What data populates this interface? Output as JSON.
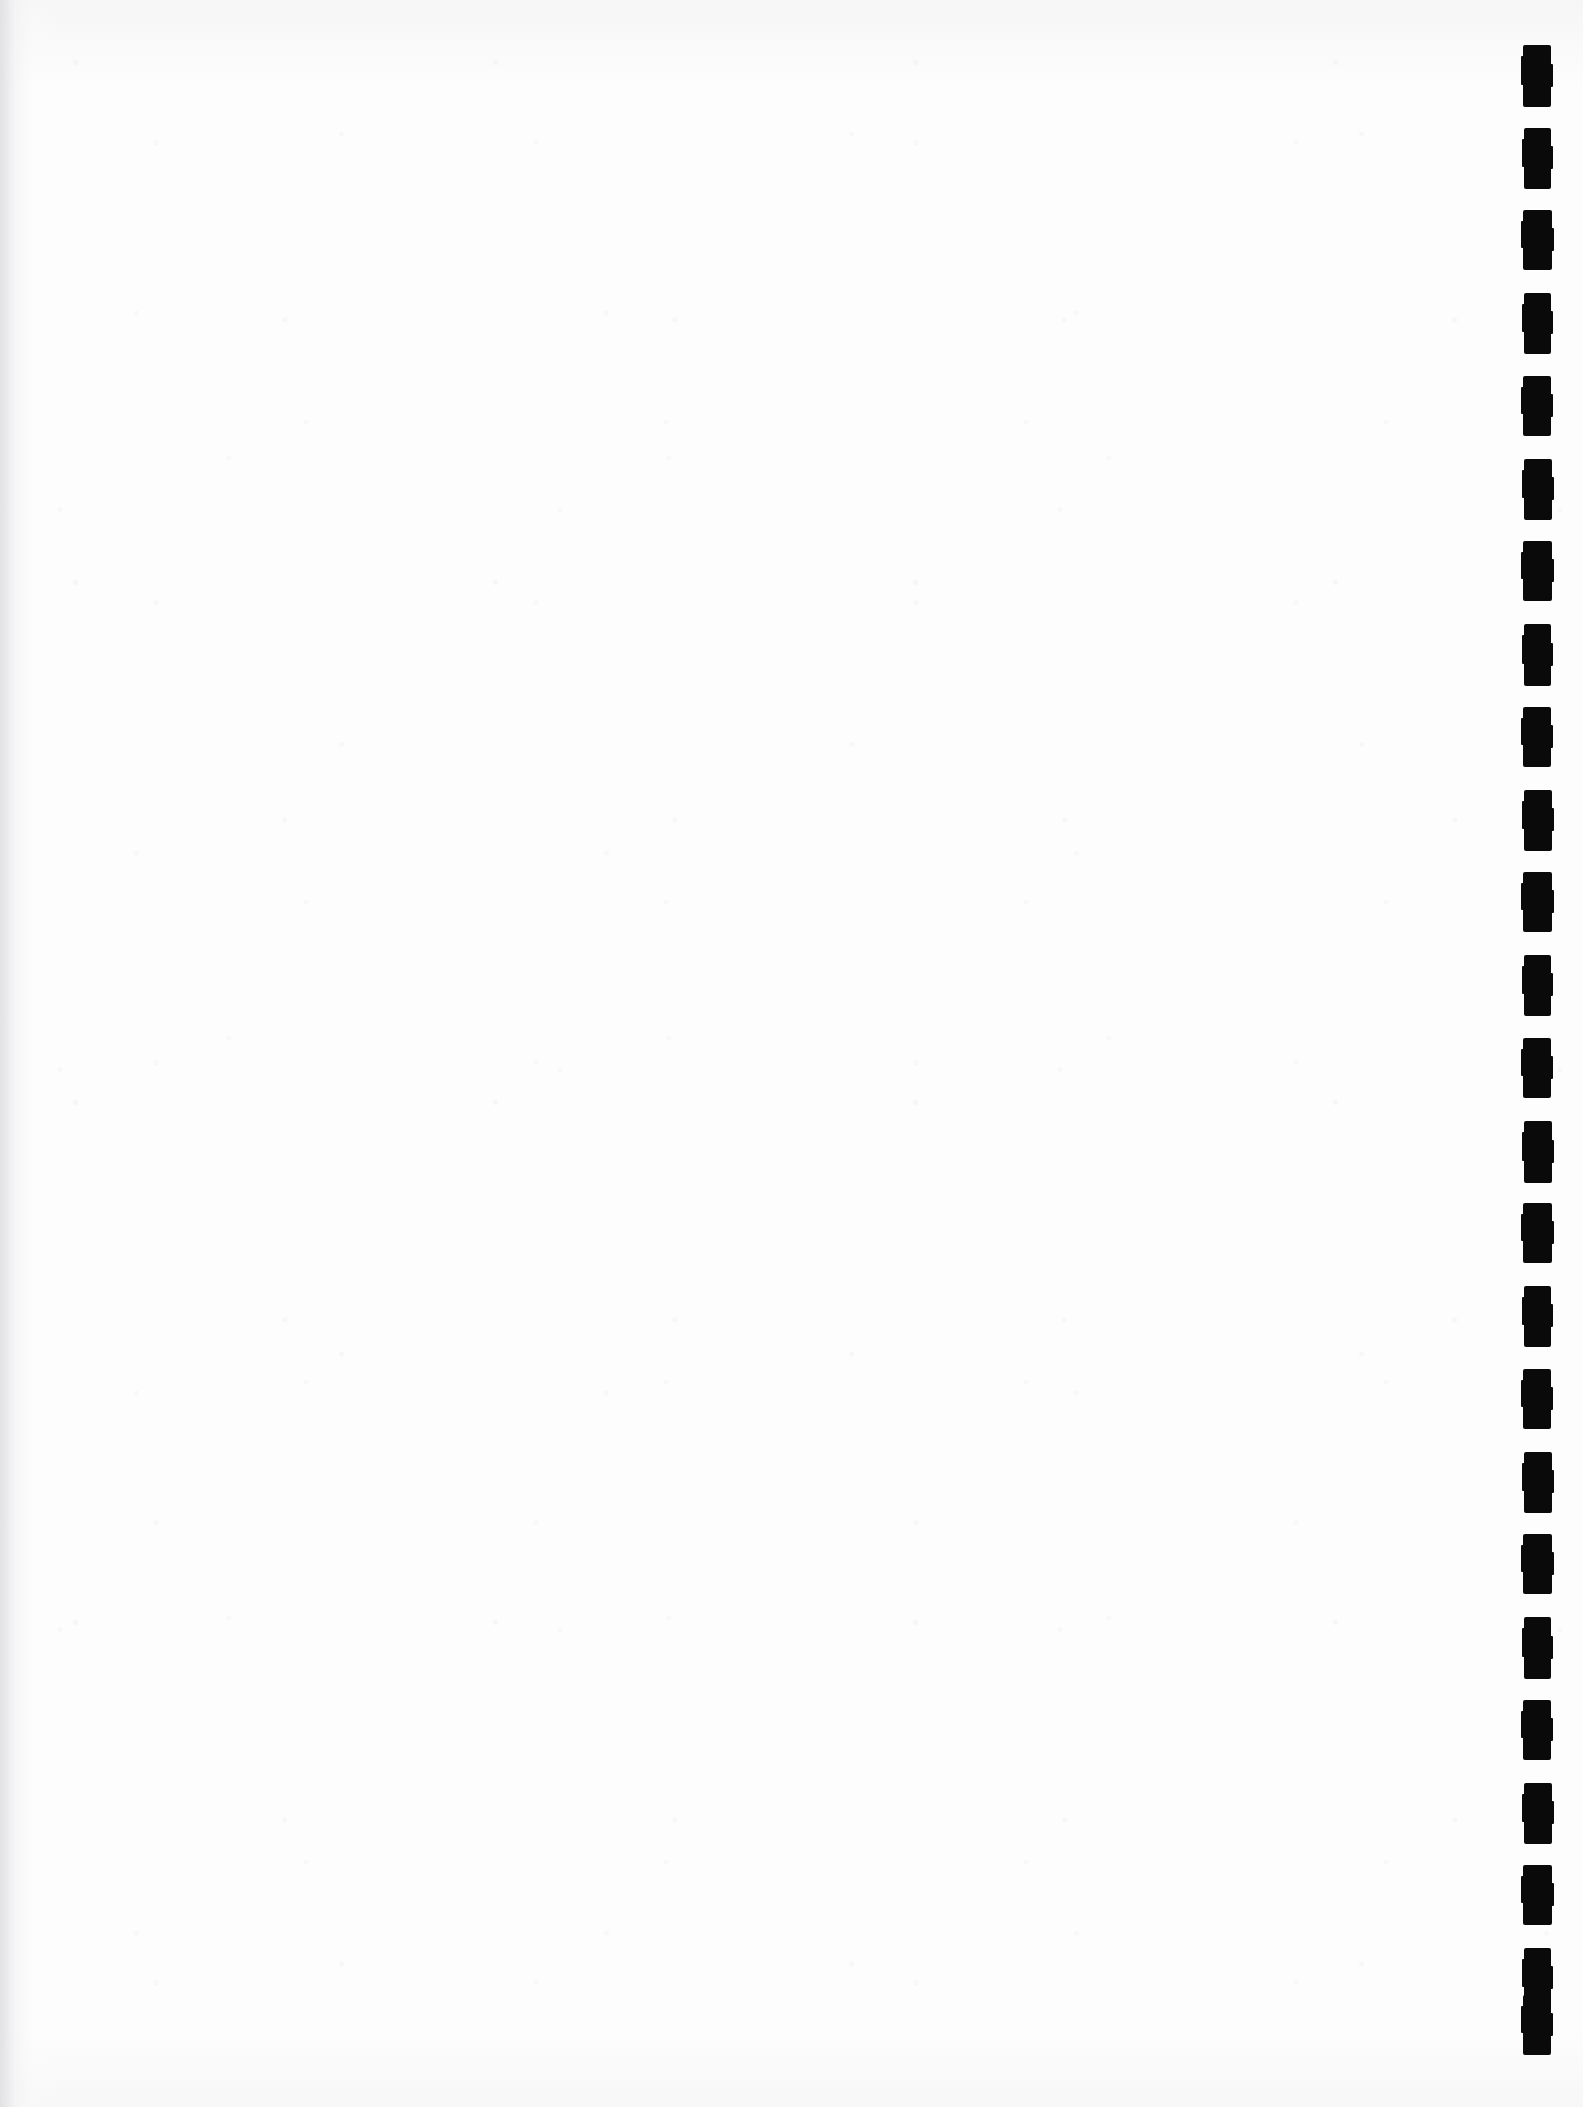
{
  "document": {
    "kind": "scanned-blank-page",
    "page_width": 1583,
    "page_height": 2107,
    "orientation": "portrait",
    "visible_text": "",
    "body_content_note": "blank",
    "paper_color": "#fdfdfd",
    "ink_color": "#0a0a0a",
    "edge_shade_color": "#e4e4e6"
  },
  "fiducial_column": {
    "name": "right-edge-registration-marks",
    "ink_color": "#0a0a0a",
    "count": 25,
    "mark_left_x": 1523,
    "mark_width": 28,
    "mark_height": 60,
    "pitch_y": 83,
    "first_mark_top_y": 45,
    "last_mark_bottom_y": 2055,
    "marks": [
      {
        "index": 1,
        "x": 1523,
        "y": 45,
        "w": 28,
        "h": 62
      },
      {
        "index": 2,
        "x": 1524,
        "y": 128,
        "w": 27,
        "h": 61
      },
      {
        "index": 3,
        "x": 1523,
        "y": 210,
        "w": 29,
        "h": 60
      },
      {
        "index": 4,
        "x": 1524,
        "y": 293,
        "w": 27,
        "h": 61
      },
      {
        "index": 5,
        "x": 1523,
        "y": 376,
        "w": 28,
        "h": 60
      },
      {
        "index": 6,
        "x": 1524,
        "y": 459,
        "w": 28,
        "h": 61
      },
      {
        "index": 7,
        "x": 1523,
        "y": 541,
        "w": 29,
        "h": 60
      },
      {
        "index": 8,
        "x": 1524,
        "y": 624,
        "w": 27,
        "h": 62
      },
      {
        "index": 9,
        "x": 1523,
        "y": 707,
        "w": 28,
        "h": 60
      },
      {
        "index": 10,
        "x": 1524,
        "y": 790,
        "w": 28,
        "h": 61
      },
      {
        "index": 11,
        "x": 1523,
        "y": 872,
        "w": 29,
        "h": 60
      },
      {
        "index": 12,
        "x": 1524,
        "y": 955,
        "w": 27,
        "h": 61
      },
      {
        "index": 13,
        "x": 1523,
        "y": 1038,
        "w": 28,
        "h": 60
      },
      {
        "index": 14,
        "x": 1524,
        "y": 1121,
        "w": 28,
        "h": 62
      },
      {
        "index": 15,
        "x": 1523,
        "y": 1203,
        "w": 29,
        "h": 60
      },
      {
        "index": 16,
        "x": 1524,
        "y": 1286,
        "w": 27,
        "h": 61
      },
      {
        "index": 17,
        "x": 1523,
        "y": 1369,
        "w": 28,
        "h": 60
      },
      {
        "index": 18,
        "x": 1524,
        "y": 1452,
        "w": 28,
        "h": 61
      },
      {
        "index": 19,
        "x": 1523,
        "y": 1534,
        "w": 29,
        "h": 60
      },
      {
        "index": 20,
        "x": 1524,
        "y": 1617,
        "w": 27,
        "h": 62
      },
      {
        "index": 21,
        "x": 1523,
        "y": 1700,
        "w": 28,
        "h": 60
      },
      {
        "index": 22,
        "x": 1524,
        "y": 1783,
        "w": 28,
        "h": 61
      },
      {
        "index": 23,
        "x": 1523,
        "y": 1865,
        "w": 29,
        "h": 60
      },
      {
        "index": 24,
        "x": 1524,
        "y": 1948,
        "w": 27,
        "h": 61
      },
      {
        "index": 25,
        "x": 1523,
        "y": 1995,
        "w": 28,
        "h": 60
      }
    ]
  }
}
